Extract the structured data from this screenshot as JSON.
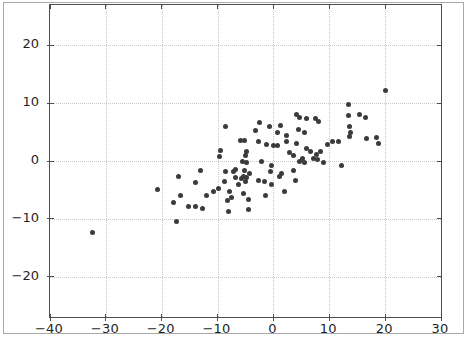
{
  "figure": {
    "background": "#ffffff",
    "border_color": "#a8a8a8"
  },
  "chart_data": {
    "type": "scatter",
    "title": "",
    "xlabel": "",
    "ylabel": "",
    "xlim": [
      -40,
      30
    ],
    "ylim": [
      -27,
      27
    ],
    "x_ticks": [
      -40,
      -30,
      -20,
      -10,
      0,
      10,
      20,
      30
    ],
    "y_ticks": [
      -20,
      -10,
      0,
      10,
      20
    ],
    "x_tick_labels": [
      "−40",
      "−30",
      "−20",
      "−10",
      "0",
      "10",
      "20",
      "30"
    ],
    "y_tick_labels": [
      "−20",
      "−10",
      "0",
      "10",
      "20"
    ],
    "grid": {
      "visible": true,
      "style": "dotted",
      "color": "#c8c8c8"
    },
    "frame_color": "#4d4d4d",
    "tick_label_color": "#1f1f1f",
    "marker": {
      "shape": "circle",
      "diameter_px": 5,
      "color": "#3b3b3b"
    },
    "points": [
      [
        -32.4,
        -12.4
      ],
      [
        -20.8,
        -5.0
      ],
      [
        -17.9,
        -7.2
      ],
      [
        -17.4,
        -10.5
      ],
      [
        -17.0,
        -2.6
      ],
      [
        -16.6,
        -6.0
      ],
      [
        -15.2,
        -7.9
      ],
      [
        -14.0,
        -3.8
      ],
      [
        -14.0,
        -7.9
      ],
      [
        -13.1,
        -1.7
      ],
      [
        -12.7,
        -8.3
      ],
      [
        -12.0,
        -5.9
      ],
      [
        -10.7,
        -5.3
      ],
      [
        -9.8,
        -4.8
      ],
      [
        -9.7,
        0.7
      ],
      [
        -9.5,
        1.9
      ],
      [
        -8.8,
        -3.6
      ],
      [
        -8.6,
        5.9
      ],
      [
        -8.6,
        -1.9
      ],
      [
        -8.2,
        -6.9
      ],
      [
        -8.1,
        -8.8
      ],
      [
        -7.9,
        -5.2
      ],
      [
        -7.5,
        -6.4
      ],
      [
        -7.2,
        -1.9
      ],
      [
        -6.8,
        -1.4
      ],
      [
        -6.8,
        -2.9
      ],
      [
        -6.3,
        -4.0
      ],
      [
        -5.9,
        3.6
      ],
      [
        -5.7,
        -3.1
      ],
      [
        -5.5,
        0.0
      ],
      [
        -5.4,
        -2.6
      ],
      [
        -5.4,
        -5.7
      ],
      [
        -5.2,
        3.6
      ],
      [
        -5.2,
        -1.7
      ],
      [
        -5.0,
        1.0
      ],
      [
        -5.0,
        -3.6
      ],
      [
        -4.8,
        1.6
      ],
      [
        -4.8,
        -0.2
      ],
      [
        -4.8,
        -2.8
      ],
      [
        -4.5,
        -6.7
      ],
      [
        -4.5,
        -8.4
      ],
      [
        -4.3,
        -2.2
      ],
      [
        -3.2,
        5.3
      ],
      [
        -2.7,
        3.4
      ],
      [
        -2.7,
        -3.4
      ],
      [
        -2.5,
        6.7
      ],
      [
        -2.1,
        0.0
      ],
      [
        -1.6,
        -3.6
      ],
      [
        -1.4,
        -6.0
      ],
      [
        -1.2,
        2.9
      ],
      [
        -0.7,
        5.9
      ],
      [
        -0.5,
        -1.9
      ],
      [
        -0.4,
        -0.7
      ],
      [
        -0.4,
        -4.0
      ],
      [
        0.0,
        2.6
      ],
      [
        0.7,
        5.0
      ],
      [
        0.7,
        2.6
      ],
      [
        1.1,
        -2.6
      ],
      [
        1.3,
        6.2
      ],
      [
        1.4,
        -2.2
      ],
      [
        2.0,
        -5.3
      ],
      [
        2.3,
        4.5
      ],
      [
        2.3,
        3.3
      ],
      [
        2.9,
        1.4
      ],
      [
        3.6,
        0.9
      ],
      [
        3.6,
        -1.7
      ],
      [
        3.9,
        -3.4
      ],
      [
        4.1,
        8.1
      ],
      [
        4.1,
        3.1
      ],
      [
        4.5,
        5.5
      ],
      [
        4.7,
        7.6
      ],
      [
        4.7,
        0.0
      ],
      [
        5.2,
        0.5
      ],
      [
        5.5,
        5.0
      ],
      [
        5.5,
        -0.2
      ],
      [
        5.9,
        7.4
      ],
      [
        5.9,
        2.1
      ],
      [
        6.6,
        1.7
      ],
      [
        7.2,
        0.5
      ],
      [
        7.5,
        7.4
      ],
      [
        7.7,
        1.2
      ],
      [
        7.9,
        0.2
      ],
      [
        8.1,
        6.9
      ],
      [
        8.4,
        1.7
      ],
      [
        9.0,
        -0.2
      ],
      [
        9.7,
        2.8
      ],
      [
        10.6,
        3.3
      ],
      [
        11.6,
        3.4
      ],
      [
        12.2,
        -0.7
      ],
      [
        13.4,
        9.7
      ],
      [
        13.4,
        7.8
      ],
      [
        13.6,
        5.9
      ],
      [
        13.8,
        5.0
      ],
      [
        13.6,
        4.3
      ],
      [
        15.4,
        8.0
      ],
      [
        16.5,
        7.5
      ],
      [
        16.6,
        3.9
      ],
      [
        18.4,
        4.1
      ],
      [
        18.8,
        3.1
      ],
      [
        20.0,
        12.2
      ]
    ]
  }
}
